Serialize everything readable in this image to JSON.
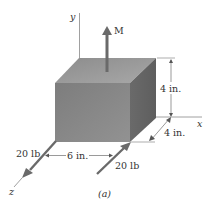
{
  "figure": {
    "caption": "(a)",
    "axes": {
      "x": "x",
      "y": "y",
      "z": "z"
    },
    "moment_label": "M",
    "dimensions": {
      "height": "4 in.",
      "depth": "4 in.",
      "force_spacing": "6 in."
    },
    "forces": [
      {
        "label": "20 lb",
        "position": "left",
        "direction": "+z"
      },
      {
        "label": "20 lb",
        "position": "right",
        "direction": "-z"
      }
    ],
    "colors": {
      "top_face": "#9a9a9a",
      "front_face": "#8a8a8a",
      "right_face": "#6e6e6e",
      "arrow": "#6a6a6a",
      "line": "#777777",
      "text": "#333333"
    }
  }
}
